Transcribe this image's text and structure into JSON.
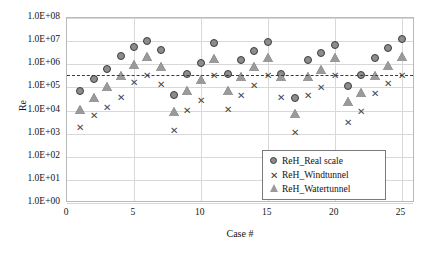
{
  "chart_data": {
    "type": "scatter",
    "title": "",
    "xlabel": "Case #",
    "ylabel": "Re",
    "yscale": "log",
    "ylim": [
      1,
      100000000
    ],
    "xlim": [
      0,
      26
    ],
    "grid": true,
    "legend_position": "bottom-right",
    "ytick_labels": [
      "1.0E+08",
      "1.0E+07",
      "1.0E+06",
      "1.0E+05",
      "1.0E+04",
      "1.0E+03",
      "1.0E+02",
      "1.0E+01",
      "1.0E+00"
    ],
    "ytick_values": [
      100000000,
      10000000,
      1000000,
      100000,
      10000,
      1000,
      100,
      10,
      1
    ],
    "xtick_labels": [
      "0",
      "5",
      "10",
      "15",
      "20",
      "25"
    ],
    "xtick_values": [
      0,
      5,
      10,
      15,
      20,
      25
    ],
    "reference_line": {
      "label": "",
      "value": 350000,
      "style": "dashed"
    },
    "x": [
      1,
      2,
      3,
      4,
      5,
      6,
      7,
      8,
      9,
      10,
      11,
      12,
      13,
      14,
      15,
      16,
      17,
      18,
      19,
      20,
      21,
      22,
      23,
      24,
      25
    ],
    "series": [
      {
        "name": "ReH_Real scale",
        "marker": "circle",
        "color": "#8c8c8c",
        "values": [
          68000,
          230000,
          620000,
          2200000,
          5500000,
          10500000,
          4200000,
          48000,
          390000,
          1100000,
          8000000,
          390000,
          1600000,
          3800000,
          9000000,
          390000,
          36000,
          1500000,
          3000000,
          7000000,
          110000,
          330000,
          1800000,
          5000000,
          12000000
        ]
      },
      {
        "name": "ReH_Windtunnel",
        "marker": "x",
        "color": "#4a4a4a",
        "values": [
          1800,
          6000,
          13000,
          38000,
          160000,
          330000,
          130000,
          1400,
          10000,
          26000,
          320000,
          11000,
          44000,
          120000,
          330000,
          38000,
          1100,
          44000,
          95000,
          330000,
          3000,
          9500,
          52000,
          150000,
          330000
        ]
      },
      {
        "name": "ReH_Watertunnel",
        "marker": "triangle",
        "color": "#9a9a9a",
        "values": [
          11000,
          36000,
          110000,
          340000,
          950000,
          2100000,
          780000,
          9000,
          75000,
          230000,
          1700000,
          75000,
          290000,
          820000,
          2000000,
          290000,
          7500,
          290000,
          620000,
          1900000,
          24000,
          62000,
          330000,
          900000,
          2200000
        ]
      }
    ]
  },
  "legend": {
    "items": [
      {
        "label": "ReH_Real scale",
        "marker": "circle-marker"
      },
      {
        "label": "ReH_Windtunnel",
        "marker": "x-marker"
      },
      {
        "label": "ReH_Watertunnel",
        "marker": "triangle-marker"
      }
    ]
  }
}
